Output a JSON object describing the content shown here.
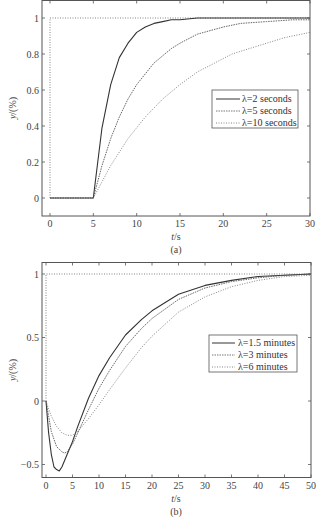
{
  "chart_data": [
    {
      "type": "line",
      "panel": "a",
      "caption": "(a)",
      "xlabel": "t/s",
      "ylabel": "y/(%)",
      "xlim": [
        -0.9,
        30
      ],
      "ylim": [
        -0.1,
        1.1
      ],
      "xticks": [
        0,
        5,
        10,
        15,
        20,
        25,
        30
      ],
      "yticks": [
        0,
        0.2,
        0.4,
        0.6,
        0.8,
        1
      ],
      "ytick_labels": [
        "0",
        "0.2",
        "0.4",
        "0.6",
        "0.8",
        "1"
      ],
      "grid": false,
      "legend_position": "center-right",
      "setpoint": {
        "name": "setpoint",
        "style": "dotted",
        "x": [
          0,
          0,
          30
        ],
        "y": [
          0,
          1,
          1
        ]
      },
      "series": [
        {
          "name": "λ=2 seconds",
          "style": "solid",
          "x": [
            0,
            5,
            6,
            7,
            8,
            9,
            10,
            11,
            12,
            13,
            14,
            15,
            17,
            20,
            25,
            30
          ],
          "y": [
            0,
            0,
            0.39,
            0.63,
            0.78,
            0.86,
            0.92,
            0.95,
            0.97,
            0.98,
            0.99,
            0.99,
            1.0,
            1.0,
            1.0,
            1.0
          ]
        },
        {
          "name": "λ=5 seconds",
          "style": "dashed",
          "x": [
            0,
            5,
            6,
            7,
            8,
            9,
            10,
            12,
            14,
            15,
            17,
            20,
            22,
            25,
            28,
            30
          ],
          "y": [
            0,
            0,
            0.18,
            0.33,
            0.45,
            0.55,
            0.63,
            0.75,
            0.83,
            0.86,
            0.91,
            0.95,
            0.97,
            0.98,
            0.99,
            0.99
          ]
        },
        {
          "name": "λ=10 seconds",
          "style": "dash-dot",
          "x": [
            0,
            5,
            7,
            9,
            11,
            13,
            15,
            17,
            19,
            21,
            23,
            25,
            27,
            30
          ],
          "y": [
            0,
            0,
            0.18,
            0.33,
            0.45,
            0.55,
            0.63,
            0.7,
            0.75,
            0.8,
            0.83,
            0.86,
            0.89,
            0.92
          ]
        }
      ]
    },
    {
      "type": "line",
      "panel": "b",
      "caption": "(b)",
      "xlabel": "t/s",
      "ylabel": "y/(%)",
      "xlim": [
        -1.5,
        50
      ],
      "ylim": [
        -0.6,
        1.1
      ],
      "xticks": [
        0,
        5,
        10,
        15,
        20,
        25,
        30,
        35,
        40,
        45,
        50
      ],
      "yticks": [
        -0.5,
        0,
        0.5,
        1
      ],
      "ytick_labels": [
        "−0.5",
        "0",
        "0.5",
        "1"
      ],
      "grid": false,
      "legend_position": "center-right",
      "setpoint": {
        "name": "setpoint",
        "style": "dotted",
        "x": [
          0,
          0,
          50
        ],
        "y": [
          0,
          1,
          1
        ]
      },
      "series": [
        {
          "name": "λ=1.5 minutes",
          "style": "solid",
          "x": [
            0,
            0.5,
            1,
            1.5,
            2,
            2.5,
            3,
            4,
            5,
            6,
            8,
            10,
            12,
            15,
            18,
            20,
            25,
            30,
            35,
            40,
            45,
            50
          ],
          "y": [
            0,
            -0.25,
            -0.42,
            -0.52,
            -0.54,
            -0.55,
            -0.52,
            -0.42,
            -0.32,
            -0.2,
            0.02,
            0.2,
            0.34,
            0.52,
            0.64,
            0.71,
            0.84,
            0.91,
            0.95,
            0.98,
            0.99,
            1.0
          ]
        },
        {
          "name": "λ=3 minutes",
          "style": "dashed",
          "x": [
            0,
            0.5,
            1,
            2,
            3,
            3.5,
            4,
            5,
            6,
            8,
            10,
            12,
            15,
            18,
            20,
            25,
            30,
            35,
            40,
            45,
            50
          ],
          "y": [
            0,
            -0.12,
            -0.24,
            -0.36,
            -0.4,
            -0.41,
            -0.4,
            -0.34,
            -0.25,
            -0.07,
            0.1,
            0.24,
            0.43,
            0.57,
            0.65,
            0.8,
            0.89,
            0.94,
            0.97,
            0.99,
            1.0
          ]
        },
        {
          "name": "λ=6 minutes",
          "style": "dash-dot",
          "x": [
            0,
            0.5,
            1,
            2,
            3,
            4,
            5,
            6,
            8,
            10,
            12,
            15,
            18,
            20,
            25,
            30,
            35,
            40,
            45,
            50
          ],
          "y": [
            0,
            -0.06,
            -0.12,
            -0.2,
            -0.25,
            -0.27,
            -0.27,
            -0.24,
            -0.14,
            -0.03,
            0.09,
            0.26,
            0.42,
            0.51,
            0.7,
            0.82,
            0.9,
            0.95,
            0.98,
            0.99
          ]
        }
      ]
    }
  ],
  "panels": {
    "a": {
      "caption": "(a)",
      "xlabel": "t/s",
      "ylabel": "y/(%)",
      "legend": [
        "λ=2 seconds",
        "λ=5 seconds",
        "λ=10 seconds"
      ]
    },
    "b": {
      "caption": "(b)",
      "xlabel": "t/s",
      "ylabel": "y/(%)",
      "legend": [
        "λ=1.5 minutes",
        "λ=3 minutes",
        "λ=6 minutes"
      ]
    }
  },
  "colors": {
    "frame": "#555555",
    "line": "#333333",
    "text": "#444444"
  }
}
